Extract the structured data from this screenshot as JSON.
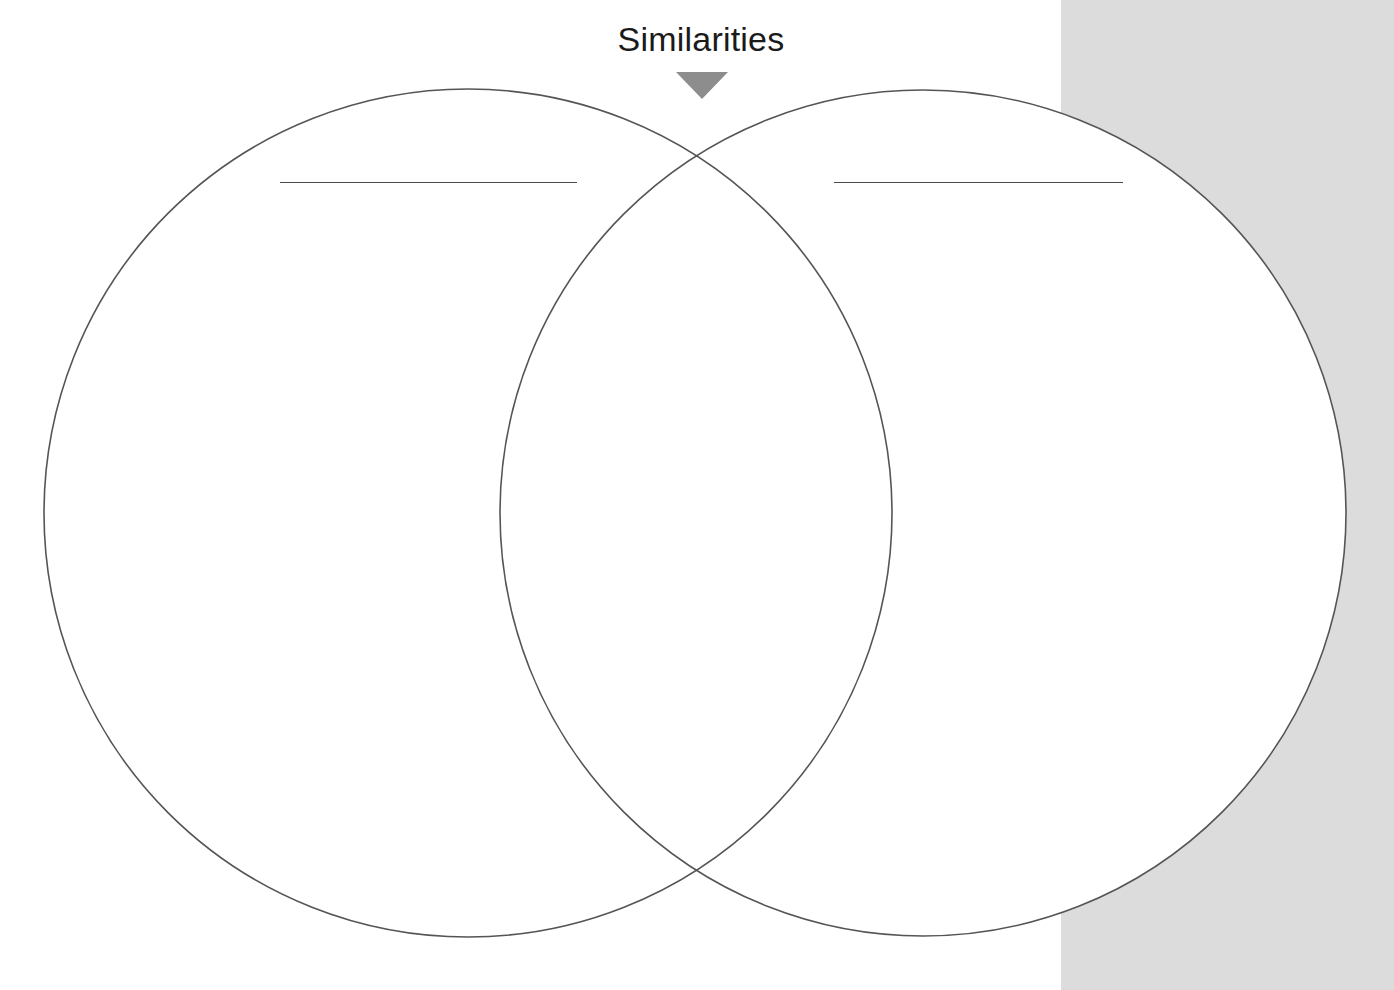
{
  "page": {
    "kind": "venn-diagram-worksheet",
    "background_color": "#ffffff",
    "scan_band_color": "#dcdcdc",
    "width": 1394,
    "height": 990
  },
  "header": {
    "title": "Similarities",
    "arrow_icon": "triangle-down-icon",
    "arrow_color": "#8d8d8d",
    "title_color": "#1a1a1a"
  },
  "venn": {
    "outline_color": "#555555",
    "fill_color": "#ffffff",
    "left_circle": {
      "label": "",
      "center_x": 468,
      "center_y": 513,
      "radius": 424
    },
    "right_circle": {
      "label": "",
      "center_x": 923,
      "center_y": 513,
      "radius": 423
    },
    "overlap_label": "Similarities"
  },
  "write_lines": [
    {
      "name": "left-topic-line",
      "value": "",
      "placeholder": ""
    },
    {
      "name": "right-topic-line",
      "value": "",
      "placeholder": ""
    }
  ]
}
